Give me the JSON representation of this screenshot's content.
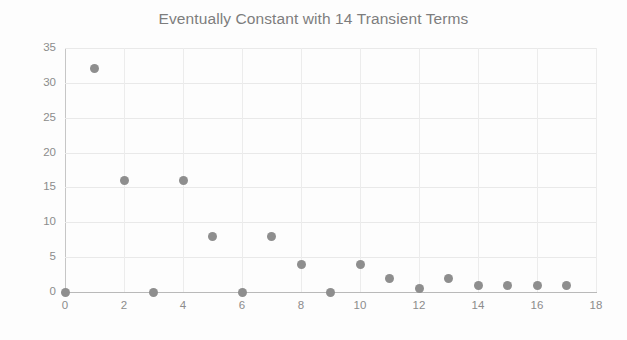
{
  "chart_data": {
    "type": "scatter",
    "title": "Eventually Constant with 14 Transient Terms",
    "xlabel": "",
    "ylabel": "",
    "x": [
      0,
      1,
      2,
      3,
      4,
      5,
      6,
      7,
      8,
      9,
      10,
      11,
      12,
      13,
      14,
      15,
      16,
      17
    ],
    "values": [
      0,
      32,
      16,
      0,
      16,
      8,
      0,
      8,
      4,
      0,
      4,
      2,
      0.5,
      2,
      1,
      1,
      1,
      1
    ],
    "series": [
      {
        "name": "sequence",
        "values": [
          0,
          32,
          16,
          0,
          16,
          8,
          0,
          8,
          4,
          0,
          4,
          2,
          0.5,
          2,
          1,
          1,
          1,
          1
        ]
      }
    ],
    "xlim": [
      0,
      18
    ],
    "ylim": [
      0,
      35
    ],
    "xticks": [
      0,
      2,
      4,
      6,
      8,
      10,
      12,
      14,
      16,
      18
    ],
    "xtick_labels": [
      "0",
      "2",
      "4",
      "6",
      "8",
      "10",
      "12",
      "14",
      "16",
      "18"
    ],
    "yticks": [
      0,
      5,
      10,
      15,
      20,
      25,
      30,
      35
    ],
    "ytick_labels": [
      "0",
      "5",
      "10",
      "15",
      "20",
      "25",
      "30",
      "35"
    ],
    "grid": true,
    "grid_x": true,
    "grid_y": true,
    "legend": false,
    "legend_position": "none",
    "marker_color": "#8e8e8e",
    "grid_color": "#e9e9e9",
    "axis_color": "#bcbcbc",
    "text_color": "#8c8c8c",
    "background": "#ffffff"
  }
}
